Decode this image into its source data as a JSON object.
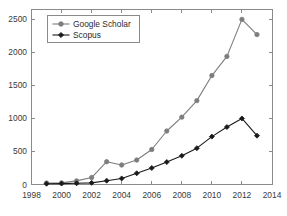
{
  "chart_data": {
    "type": "line",
    "title": "",
    "subtitle": "",
    "xlabel": "",
    "ylabel": "",
    "xlim": [
      1998,
      2014
    ],
    "ylim": [
      0,
      2650
    ],
    "grid": false,
    "legend_position": "upper-left",
    "x": [
      1999,
      2000,
      2001,
      2002,
      2003,
      2004,
      2005,
      2006,
      2007,
      2008,
      2009,
      2010,
      2011,
      2012,
      2013
    ],
    "x_tick_labels": [
      "1998",
      "2000",
      "2002",
      "2004",
      "2006",
      "2008",
      "2010",
      "2012",
      "2014"
    ],
    "x_ticks": [
      1998,
      2000,
      2002,
      2004,
      2006,
      2008,
      2010,
      2012,
      2014
    ],
    "y_tick_labels": [
      "0",
      "500",
      "1000",
      "1500",
      "2000",
      "2500"
    ],
    "y_ticks": [
      0,
      500,
      1000,
      1500,
      2000,
      2500
    ],
    "series": [
      {
        "name": "Google Scholar",
        "color": "#7d7d7d",
        "marker": "circle",
        "values": [
          22,
          25,
          55,
          105,
          345,
          295,
          370,
          530,
          810,
          1020,
          1270,
          1650,
          1940,
          2500,
          2270
        ]
      },
      {
        "name": "Scopus",
        "color": "#1a1a1a",
        "marker": "diamond",
        "values": [
          12,
          14,
          18,
          25,
          58,
          92,
          170,
          250,
          340,
          435,
          550,
          725,
          870,
          1000,
          740
        ]
      }
    ]
  },
  "legend": {
    "entries": [
      {
        "label": "Google Scholar"
      },
      {
        "label": "Scopus"
      }
    ]
  },
  "colors": {
    "google_scholar": "#7d7d7d",
    "scopus": "#1a1a1a",
    "axis": "#8a8a8a",
    "background": "#ffffff"
  }
}
